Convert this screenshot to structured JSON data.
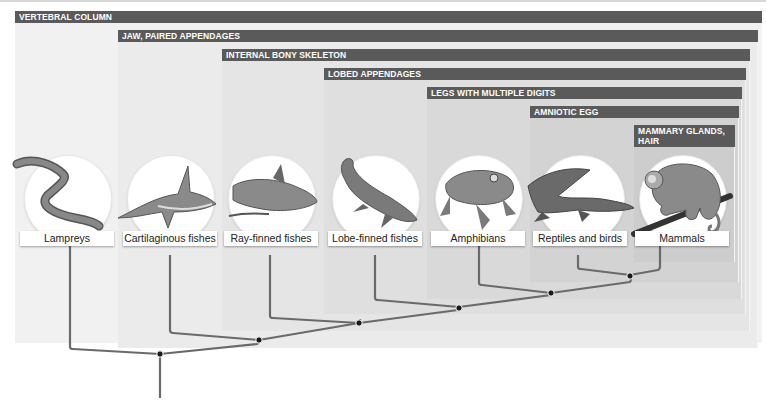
{
  "diagram": {
    "type": "cladogram",
    "colors": {
      "bar": "#5a5a5a",
      "bar_text": "#ffffff",
      "panel_shades": [
        "#f1f1f1",
        "#ebebeb",
        "#e5e5e5",
        "#dfdfdf",
        "#d9d9d9",
        "#d3d3d3",
        "#cdcdcd"
      ],
      "branch": "#666666",
      "node": "#1a1a1a"
    },
    "characters": [
      {
        "id": "vertebral-column",
        "label": "VERTEBRAL COLUMN"
      },
      {
        "id": "jaw-paired-appendages",
        "label": "JAW, PAIRED APPENDAGES"
      },
      {
        "id": "internal-bony-skeleton",
        "label": "INTERNAL BONY SKELETON"
      },
      {
        "id": "lobed-appendages",
        "label": "LOBED APPENDAGES"
      },
      {
        "id": "legs-multiple-digits",
        "label": "LEGS WITH MULTIPLE DIGITS"
      },
      {
        "id": "amniotic-egg",
        "label": "AMNIOTIC EGG"
      },
      {
        "id": "mammary-glands-hair",
        "label": "MAMMARY GLANDS, HAIR"
      }
    ],
    "taxa": [
      {
        "id": "lampreys",
        "label": "Lampreys",
        "icon": "lamprey-icon"
      },
      {
        "id": "cartilaginous-fishes",
        "label": "Cartilaginous fishes",
        "icon": "shark-icon"
      },
      {
        "id": "ray-finned-fishes",
        "label": "Ray-finned fishes",
        "icon": "ray-finned-fish-icon"
      },
      {
        "id": "lobe-finned-fishes",
        "label": "Lobe-finned fishes",
        "icon": "coelacanth-icon"
      },
      {
        "id": "amphibians",
        "label": "Amphibians",
        "icon": "frog-icon"
      },
      {
        "id": "reptiles-birds",
        "label": "Reptiles and birds",
        "icon": "crocodile-icon"
      },
      {
        "id": "mammals",
        "label": "Mammals",
        "icon": "monkey-icon"
      }
    ],
    "nodes_count": 6
  }
}
